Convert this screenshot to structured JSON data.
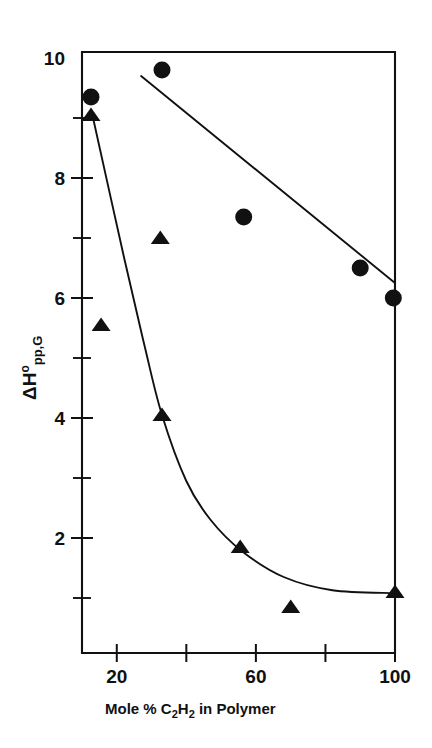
{
  "chart_data": {
    "type": "scatter",
    "title": "",
    "xlabel": "Mole % C2H2 in Polymer",
    "xlabel_parts": [
      "Mole % C",
      "2",
      "H",
      "2",
      " in Polymer"
    ],
    "ylabel": "ΔH°pp,G",
    "ylabel_parts": [
      "Δ",
      "H",
      "o",
      "pp,G"
    ],
    "xlim": [
      10,
      100
    ],
    "ylim": [
      0,
      10
    ],
    "xticks": [
      20,
      40,
      60,
      80,
      100
    ],
    "xtick_labels": [
      "20",
      "",
      "60",
      "",
      "100"
    ],
    "yticks": [
      0,
      1,
      2,
      3,
      4,
      5,
      6,
      7,
      8,
      9,
      10
    ],
    "ytick_labels": [
      "",
      "",
      "2",
      "",
      "4",
      "",
      "6",
      "",
      "8",
      "",
      "10"
    ],
    "grid": false,
    "legend": "none",
    "series": [
      {
        "name": "circles",
        "marker": "circle",
        "points": [
          {
            "x": 12.6,
            "y": 9.35
          },
          {
            "x": 33.0,
            "y": 9.8
          },
          {
            "x": 56.5,
            "y": 7.35
          },
          {
            "x": 90.0,
            "y": 6.5
          },
          {
            "x": 99.5,
            "y": 6.0
          }
        ],
        "fit": {
          "type": "line",
          "points": [
            {
              "x": 27.0,
              "y": 9.7
            },
            {
              "x": 100.0,
              "y": 6.25
            }
          ]
        }
      },
      {
        "name": "triangles",
        "marker": "triangle",
        "points": [
          {
            "x": 12.6,
            "y": 9.05
          },
          {
            "x": 15.5,
            "y": 5.55
          },
          {
            "x": 32.5,
            "y": 7.0
          },
          {
            "x": 33.0,
            "y": 4.05
          },
          {
            "x": 55.5,
            "y": 1.85
          },
          {
            "x": 70.0,
            "y": 0.85
          },
          {
            "x": 100.0,
            "y": 1.1
          }
        ],
        "fit": {
          "type": "curve",
          "points": [
            {
              "x": 13.0,
              "y": 9.05
            },
            {
              "x": 22.0,
              "y": 6.7
            },
            {
              "x": 28.0,
              "y": 5.2
            },
            {
              "x": 33.0,
              "y": 4.05
            },
            {
              "x": 40.0,
              "y": 2.95
            },
            {
              "x": 47.0,
              "y": 2.3
            },
            {
              "x": 56.0,
              "y": 1.78
            },
            {
              "x": 68.0,
              "y": 1.35
            },
            {
              "x": 82.0,
              "y": 1.13
            },
            {
              "x": 100.0,
              "y": 1.08
            }
          ]
        }
      }
    ]
  }
}
